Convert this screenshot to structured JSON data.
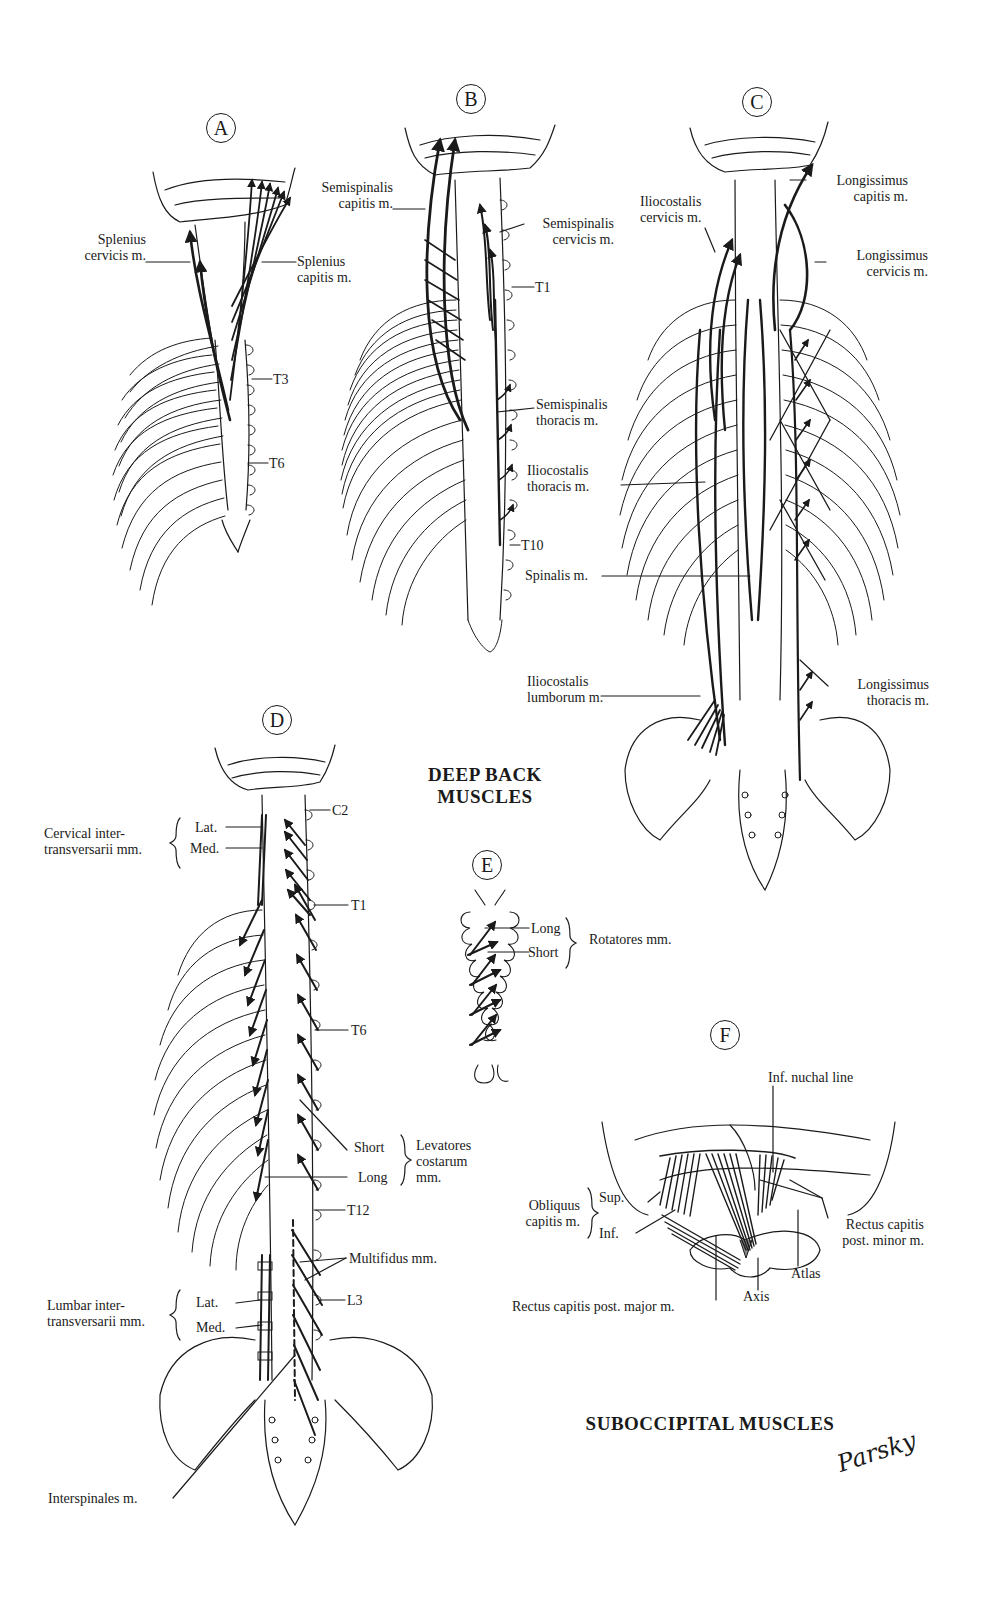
{
  "figure": {
    "title": "DEEP BACK MUSCLES",
    "title_lines": [
      "DEEP BACK",
      "MUSCLES"
    ],
    "subtitle": "SUBOCCIPITAL MUSCLES",
    "signature": "Parsky"
  },
  "panels": {
    "A": {
      "letter": "A",
      "labels": {
        "splenius_cervicis": [
          "Splenius",
          "cervicis m."
        ],
        "splenius_capitis": [
          "Splenius",
          "capitis m."
        ],
        "t3": "T3",
        "t6": "T6"
      }
    },
    "B": {
      "letter": "B",
      "labels": {
        "semispinalis_capitis": [
          "Semispinalis",
          "capitis m."
        ],
        "semispinalis_cervicis": [
          "Semispinalis",
          "cervicis m."
        ],
        "t1": "T1",
        "semispinalis_thoracis": [
          "Semispinalis",
          "thoracis m."
        ],
        "t10": "T10"
      }
    },
    "C": {
      "letter": "C",
      "labels": {
        "iliocostalis_cervicis": [
          "Iliocostalis",
          "cervicis m."
        ],
        "longissimus_capitis": [
          "Longissimus",
          "capitis m."
        ],
        "longissimus_cervicis": [
          "Longissimus",
          "cervicis m."
        ],
        "iliocostalis_thoracis": [
          "Iliocostalis",
          "thoracis m."
        ],
        "spinalis": "Spinalis m.",
        "iliocostalis_lumborum": [
          "Iliocostalis",
          "lumborum m."
        ],
        "longissimus_thoracis": [
          "Longissimus",
          "thoracis m."
        ]
      }
    },
    "D": {
      "letter": "D",
      "labels": {
        "c2": "C2",
        "cervical_intertransversarii": [
          "Cervical inter-",
          "transversarii mm."
        ],
        "cervical_lat": "Lat.",
        "cervical_med": "Med.",
        "t1": "T1",
        "t6": "T6",
        "levatores_short": "Short",
        "levatores_long": "Long",
        "levatores_costarum": [
          "Levatores",
          "costarum",
          "mm."
        ],
        "t12": "T12",
        "multifidus": "Multifidus mm.",
        "l3": "L3",
        "lumbar_intertransversarii": [
          "Lumbar inter-",
          "transversarii mm."
        ],
        "lumbar_lat": "Lat.",
        "lumbar_med": "Med.",
        "interspinales": "Interspinales m."
      }
    },
    "E": {
      "letter": "E",
      "labels": {
        "long": "Long",
        "short": "Short",
        "rotatores": "Rotatores mm."
      }
    },
    "F": {
      "letter": "F",
      "labels": {
        "inf_nuchal_line": "Inf. nuchal line",
        "obliquus_capitis": [
          "Obliquus",
          "capitis m."
        ],
        "sup": "Sup.",
        "inf": "Inf.",
        "rectus_minor": [
          "Rectus capitis",
          "post. minor m."
        ],
        "atlas": "Atlas",
        "axis": "Axis",
        "rectus_major": "Rectus capitis post. major m."
      }
    }
  },
  "colors": {
    "ink": "#1a1a1a",
    "paper": "#ffffff"
  }
}
